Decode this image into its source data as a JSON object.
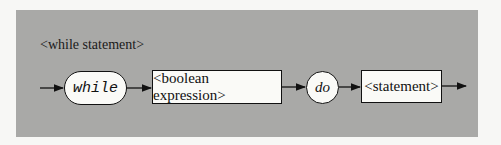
{
  "diagram": {
    "title": "<while statement>",
    "type": "syntax-diagram",
    "nodes": [
      {
        "id": "while",
        "label": "while",
        "shape": "rounded-terminal"
      },
      {
        "id": "cond",
        "label": "<boolean expression>",
        "shape": "rectangle-nonterminal"
      },
      {
        "id": "do",
        "label": "do",
        "shape": "circle-terminal"
      },
      {
        "id": "stmt",
        "label": "<statement>",
        "shape": "rectangle-nonterminal"
      }
    ],
    "edges": [
      [
        "entry",
        "while"
      ],
      [
        "while",
        "cond"
      ],
      [
        "cond",
        "do"
      ],
      [
        "do",
        "stmt"
      ],
      [
        "stmt",
        "exit"
      ]
    ],
    "colors": {
      "panel": "#a9a9a7",
      "node_fill": "#fafaf7",
      "stroke": "#111111"
    }
  }
}
